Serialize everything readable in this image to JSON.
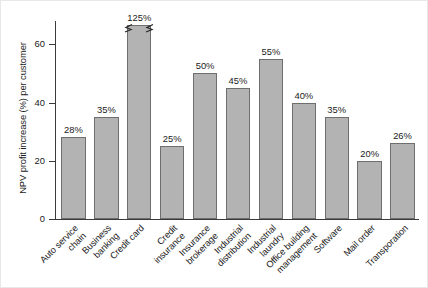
{
  "chart_data": {
    "type": "bar",
    "title": "",
    "xlabel": "",
    "ylabel": "NPV profit increase (%) per customer",
    "ylim": [
      0,
      68
    ],
    "yticks": [
      0,
      20,
      40,
      60
    ],
    "ytick_labels": [
      "0",
      "20",
      "40",
      "60"
    ],
    "grid": false,
    "legend": null,
    "axis_break": {
      "present": true,
      "on_category": "Credit card",
      "note": "bar truncated with zigzag break marks on both sides"
    },
    "categories": [
      "Auto service chain",
      "Business banking",
      "Credit card",
      "Credit insurance",
      "Insurance brokerage",
      "Industrial distribution",
      "Industrial laundry",
      "Office building management",
      "Software",
      "Mail order",
      "Transporation"
    ],
    "values": [
      28,
      35,
      125,
      25,
      50,
      45,
      55,
      40,
      35,
      20,
      26
    ],
    "value_labels": [
      "28%",
      "35%",
      "125%",
      "25%",
      "50%",
      "45%",
      "55%",
      "40%",
      "35%",
      "20%",
      "26%"
    ],
    "bar_color": "#b3b3b3",
    "bar_edge_color": "#6e6e6e",
    "axis_color": "#3a3a3a",
    "background_color": "#ffffff"
  },
  "x_label_lines": [
    [
      "Auto service",
      "chain"
    ],
    [
      "Business",
      "banking"
    ],
    [
      "Credit card"
    ],
    [
      "Credit",
      "insurance"
    ],
    [
      "Insurance",
      "brokerage"
    ],
    [
      "Industrial",
      "distribution"
    ],
    [
      "Industrial",
      "laundry"
    ],
    [
      "Office building",
      "management"
    ],
    [
      "Software"
    ],
    [
      "Mail order"
    ],
    [
      "Transporation"
    ]
  ]
}
